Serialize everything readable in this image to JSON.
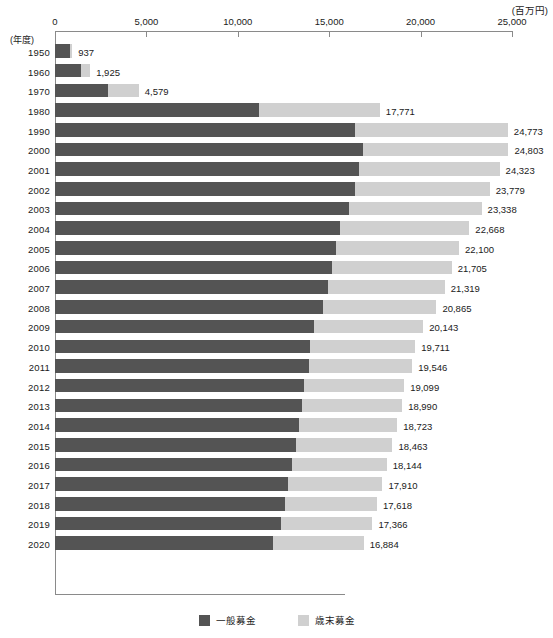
{
  "axis": {
    "unit_label": "(百万円)",
    "year_caption": "(年度)",
    "xticks": [
      0,
      5000,
      10000,
      15000,
      20000,
      25000
    ],
    "xtick_labels": [
      "0",
      "5,000",
      "10,000",
      "15,000",
      "20,000",
      "25,000"
    ]
  },
  "legend": {
    "items": [
      {
        "label": "一般募金",
        "color": "#545454"
      },
      {
        "label": "歳末募金",
        "color": "#d0d0d0"
      }
    ]
  },
  "colors": {
    "general": "#545454",
    "yearend": "#d0d0d0",
    "axis": "#8a8a8a",
    "text": "#1a1a1a"
  },
  "chart_data": {
    "type": "bar",
    "orientation": "horizontal",
    "stacked": true,
    "title": "",
    "xlabel": "(百万円)",
    "ylabel": "(年度)",
    "xlim": [
      0,
      25000
    ],
    "grid": false,
    "legend_position": "bottom-center",
    "categories": [
      "1950",
      "1960",
      "1970",
      "1980",
      "1990",
      "2000",
      "2001",
      "2002",
      "2003",
      "2004",
      "2005",
      "2006",
      "2007",
      "2008",
      "2009",
      "2010",
      "2011",
      "2012",
      "2013",
      "2014",
      "2015",
      "2016",
      "2017",
      "2018",
      "2019",
      "2020"
    ],
    "series": [
      {
        "name": "一般募金",
        "color": "#545454",
        "values": [
          840,
          1430,
          2900,
          11150,
          16430,
          16870,
          16640,
          16410,
          16070,
          15600,
          15390,
          15180,
          14960,
          14670,
          14180,
          13940,
          13870,
          13600,
          13500,
          13350,
          13170,
          12960,
          12770,
          12600,
          12370,
          11900
        ]
      },
      {
        "name": "歳末募金",
        "color": "#d0d0d0",
        "values": [
          97,
          495,
          1679,
          6621,
          8343,
          7933,
          7683,
          7369,
          7268,
          7068,
          6710,
          6525,
          6359,
          6195,
          5963,
          5771,
          5676,
          5499,
          5490,
          5373,
          5293,
          5184,
          5140,
          5018,
          4996,
          4984
        ]
      }
    ],
    "totals": [
      937,
      1925,
      4579,
      17771,
      24773,
      24803,
      24323,
      23779,
      23338,
      22668,
      22100,
      21705,
      21319,
      20865,
      20143,
      19711,
      19546,
      19099,
      18990,
      18723,
      18463,
      18144,
      17910,
      17618,
      17366,
      16884
    ],
    "total_labels": [
      "937",
      "1,925",
      "4,579",
      "17,771",
      "24,773",
      "24,803",
      "24,323",
      "23,779",
      "23,338",
      "22,668",
      "22,100",
      "21,705",
      "21,319",
      "20,865",
      "20,143",
      "19,711",
      "19,546",
      "19,099",
      "18,990",
      "18,723",
      "18,463",
      "18,144",
      "17,910",
      "17,618",
      "17,366",
      "16,884"
    ]
  }
}
